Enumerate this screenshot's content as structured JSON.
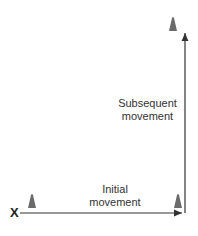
{
  "diagram": {
    "start_marker": "X",
    "labels": {
      "initial": [
        "Initial",
        "movement"
      ],
      "subsequent": [
        "Subsequent",
        "movement"
      ]
    },
    "colors": {
      "cone": "#6b6b6b",
      "arrow": "#333333",
      "text": "#333333"
    },
    "cones": [
      {
        "id": "cone-start",
        "x": 32,
        "y": 202
      },
      {
        "id": "cone-corner",
        "x": 178,
        "y": 202
      },
      {
        "id": "cone-top",
        "x": 173,
        "y": 22
      }
    ]
  }
}
